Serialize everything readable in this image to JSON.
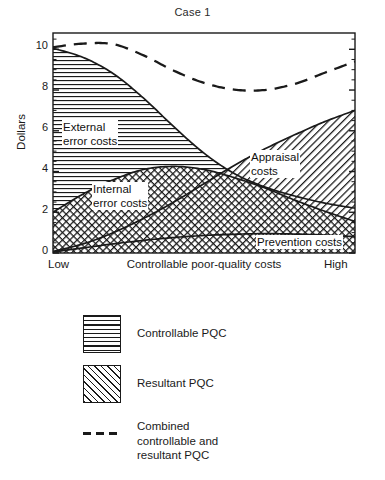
{
  "chart_data": {
    "type": "area",
    "title": "Case 1",
    "xlabel": "Controllable poor-quality costs",
    "ylabel": "Dollars",
    "xlim": [
      0,
      100
    ],
    "ylim": [
      0,
      10.8
    ],
    "grid": false,
    "legend_position": "below",
    "x_tick_labels": [
      "Low",
      "High"
    ],
    "y_tick_labels": [
      "0",
      "2",
      "4",
      "6",
      "8",
      "10"
    ],
    "y_tick_values": [
      0,
      2,
      4,
      6,
      8,
      10
    ],
    "y_minor_tick_step": 0.5,
    "x": [
      0,
      10,
      20,
      30,
      40,
      50,
      60,
      70,
      80,
      90,
      100
    ],
    "series": [
      {
        "name": "Prevention costs",
        "fill": "resultant-hatch",
        "values": [
          0.05,
          0.25,
          0.45,
          0.62,
          0.76,
          0.86,
          0.92,
          0.95,
          0.93,
          0.88,
          0.8
        ]
      },
      {
        "name": "Internal error costs",
        "fill": "controllable-hlines",
        "cumulative_top": [
          2.0,
          2.9,
          3.6,
          4.1,
          4.25,
          4.1,
          3.7,
          3.2,
          2.6,
          2.05,
          1.55
        ]
      },
      {
        "name": "External error costs",
        "fill": "controllable-hlines",
        "cumulative_top": [
          10.05,
          9.6,
          8.8,
          7.6,
          6.2,
          4.9,
          3.9,
          3.25,
          2.8,
          2.45,
          2.2
        ]
      },
      {
        "name": "Appraisal costs",
        "fill": "resultant-hatch",
        "cumulative_top": [
          0.08,
          0.45,
          1.0,
          1.7,
          2.5,
          3.4,
          4.3,
          5.1,
          5.8,
          6.45,
          7.0
        ]
      },
      {
        "name": "Combined controllable and resultant PQC",
        "style": "dashed",
        "values": [
          10.1,
          10.28,
          10.25,
          9.7,
          8.95,
          8.35,
          8.02,
          8.0,
          8.3,
          8.85,
          9.4
        ]
      }
    ],
    "annotations": [
      {
        "id": "external",
        "text_line1": "External",
        "text_line2": "error costs"
      },
      {
        "id": "internal",
        "text_line1": "Internal",
        "text_line2": "error costs"
      },
      {
        "id": "appraisal",
        "text_line1": "Appraisal",
        "text_line2": "costs"
      },
      {
        "id": "prevention",
        "text_line1": "Prevention costs",
        "text_line2": ""
      }
    ]
  },
  "title": "Case 1",
  "axes": {
    "y_title": "Dollars",
    "x_title": "Controllable poor-quality costs",
    "x_low": "Low",
    "x_high": "High",
    "y_ticks": [
      "10",
      "8",
      "6",
      "4",
      "2",
      "0"
    ]
  },
  "annotations": {
    "external_line1": "External",
    "external_line2": "error costs",
    "internal_line1": "Internal",
    "internal_line2": "error costs",
    "appraisal_line1": "Appraisal",
    "appraisal_line2": "costs",
    "prevention": "Prevention costs"
  },
  "legend": {
    "items": [
      {
        "label": "Controllable PQC",
        "swatch": "horizontal-lines-swatch"
      },
      {
        "label": "Resultant PQC",
        "swatch": "diagonal-hatch-swatch"
      },
      {
        "label_line1": "Combined",
        "label_line2": "controllable and",
        "label_line3": "resultant PQC",
        "swatch": "dashed-line-swatch"
      }
    ]
  },
  "colors": {
    "ink": "#1a1a1a",
    "background": "#ffffff"
  }
}
